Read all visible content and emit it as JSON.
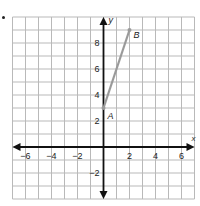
{
  "chart_data": {
    "type": "line",
    "title": "",
    "xlabel": "x",
    "ylabel": "y",
    "xlim": [
      -7,
      7
    ],
    "ylim": [
      -4,
      10
    ],
    "grid": true,
    "x_ticks": [
      -6,
      -4,
      -2,
      2,
      4,
      6
    ],
    "y_ticks": [
      -2,
      2,
      4,
      6,
      8
    ],
    "series": [
      {
        "name": "segment AB",
        "points": [
          {
            "label": "A",
            "x": 0,
            "y": 3
          },
          {
            "label": "B",
            "x": 2,
            "y": 9
          }
        ],
        "color": "#9a9a9a"
      }
    ]
  },
  "colors": {
    "grid": "#b9b9b9",
    "axis": "#111111",
    "segment": "#9a9a9a"
  }
}
